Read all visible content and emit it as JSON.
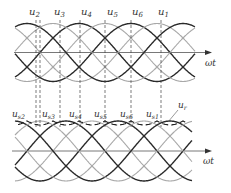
{
  "diagram": {
    "upper": {
      "axis_label": "ωt",
      "phase_labels": [
        "u2",
        "u3",
        "u4",
        "u5",
        "u6",
        "u1"
      ],
      "label_positions_x": [
        29,
        54,
        81,
        107,
        132,
        158
      ]
    },
    "lower": {
      "axis_label": "ωt",
      "phase_labels": [
        "us2",
        "us3",
        "us4",
        "us5",
        "us6",
        "us1"
      ],
      "label_positions_x": [
        12,
        42,
        69,
        94,
        120,
        146
      ],
      "resultant_label": "ur"
    },
    "dashed_lines_x": [
      36,
      40,
      60,
      80,
      105,
      131,
      161
    ],
    "colors": {
      "dark": "#2a2a2a",
      "light": "#a8a8a8",
      "axis": "#555555"
    }
  }
}
